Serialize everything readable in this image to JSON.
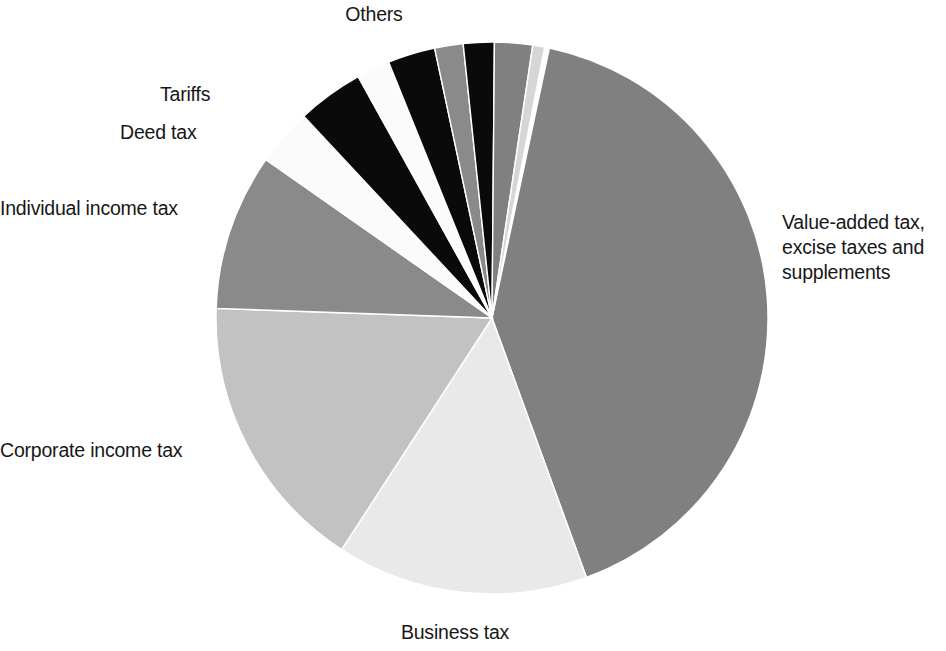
{
  "chart_data": {
    "type": "pie",
    "title": "",
    "subtitle": "",
    "xlabel": "",
    "ylabel": "",
    "legend_position": "none",
    "labels_position": "outside-callout-free",
    "grid": false,
    "start_angle_deg": 12,
    "direction": "clockwise",
    "categories": [
      "Value-added tax, excise taxes and supplements",
      "Business tax",
      "Corporate income tax",
      "Individual income tax",
      "Deed tax",
      "Tariffs",
      "Others"
    ],
    "values": [
      41.1,
      14.7,
      16.4,
      9.2,
      3.3,
      3.9,
      11.4
    ],
    "slices": [
      {
        "label": "Value-added tax, excise taxes and supplements",
        "value": 41.1,
        "color": "#808080",
        "start_deg": 12,
        "end_deg": 160
      },
      {
        "label": "Business tax",
        "value": 14.7,
        "color": "#e9e9e9",
        "start_deg": 160,
        "end_deg": 213
      },
      {
        "label": "Corporate income tax",
        "value": 16.4,
        "color": "#c2c2c2",
        "start_deg": 213,
        "end_deg": 272
      },
      {
        "label": "Individual income tax",
        "value": 9.2,
        "color": "#8a8a8a",
        "start_deg": 272,
        "end_deg": 305
      },
      {
        "label": "Deed tax",
        "value": 3.3,
        "color": "#fbfbfb",
        "start_deg": 305,
        "end_deg": 317
      },
      {
        "label": "Tariffs",
        "value": 3.9,
        "color": "#0a0a0a",
        "start_deg": 317,
        "end_deg": 331
      },
      {
        "label": "Others",
        "value": 11.4,
        "color": "#8a8a8a",
        "start_deg": 331,
        "end_deg": 372,
        "sub_slices": [
          {
            "color": "#fbfbfb",
            "start_deg": 331,
            "end_deg": 338
          },
          {
            "color": "#0a0a0a",
            "start_deg": 338,
            "end_deg": 348
          },
          {
            "color": "#8a8a8a",
            "start_deg": 348,
            "end_deg": 354
          },
          {
            "color": "#0a0a0a",
            "start_deg": 354,
            "end_deg": 360.5
          },
          {
            "color": "#808080",
            "start_deg": 360.5,
            "end_deg": 368.5
          },
          {
            "color": "#d6d6d6",
            "start_deg": 368.5,
            "end_deg": 371
          }
        ]
      }
    ]
  },
  "geometry": {
    "center_x": 492,
    "center_y": 318,
    "radius": 276
  },
  "labels": {
    "value_added_tax": "Value-added tax,\nexcise taxes and\nsupplements",
    "business_tax": "Business tax",
    "corporate_income_tax": "Corporate income tax",
    "individual_income_tax": "Individual income tax",
    "deed_tax": "Deed tax",
    "tariffs": "Tariffs",
    "others": "Others"
  }
}
